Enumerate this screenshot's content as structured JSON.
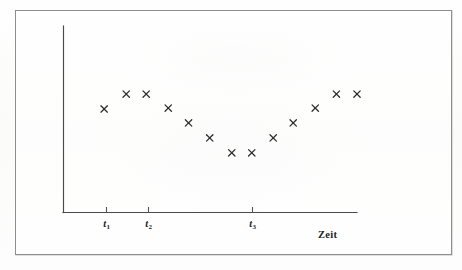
{
  "figure": {
    "frame": {
      "x": 15,
      "y": 10,
      "width": 435,
      "height": 243,
      "border_color": "#8e8e8e"
    },
    "background_color": "#fdfdfc",
    "ink_color": "#2b2b2b",
    "axis_color": "#4a4a4a"
  },
  "chart_data": {
    "type": "scatter",
    "title": "",
    "subtitle": "",
    "xlabel": "Zeit",
    "ylabel": "",
    "marker": "x",
    "marker_label": "cross-marker",
    "grid": false,
    "legend": null,
    "legend_position": "none",
    "xlim": [
      0,
      10
    ],
    "ylim": [
      0,
      10
    ],
    "axis_style": "open-L-axes-no-arrowheads",
    "tick_labels": [
      "t1",
      "t2",
      "t3"
    ],
    "tick_labels_display": [
      "t₁",
      "t₂",
      "t₃"
    ],
    "tick_positions_x": [
      1.5,
      2.9,
      6.4
    ],
    "x": [
      1.4,
      2.15,
      2.83,
      3.58,
      4.27,
      4.99,
      5.74,
      6.42,
      7.15,
      7.83,
      8.58,
      9.3,
      10.0
    ],
    "y": [
      5.55,
      6.35,
      6.35,
      5.6,
      4.8,
      4.0,
      3.2,
      3.2,
      4.0,
      4.8,
      5.6,
      6.35,
      6.35
    ],
    "points": [
      {
        "x": 1.4,
        "y": 5.55
      },
      {
        "x": 2.15,
        "y": 6.35
      },
      {
        "x": 2.83,
        "y": 6.35
      },
      {
        "x": 3.58,
        "y": 5.6
      },
      {
        "x": 4.27,
        "y": 4.8
      },
      {
        "x": 4.99,
        "y": 4.0
      },
      {
        "x": 5.74,
        "y": 3.2
      },
      {
        "x": 6.42,
        "y": 3.2
      },
      {
        "x": 7.15,
        "y": 4.0
      },
      {
        "x": 7.83,
        "y": 4.8
      },
      {
        "x": 8.58,
        "y": 5.6
      },
      {
        "x": 9.3,
        "y": 6.35
      },
      {
        "x": 10.0,
        "y": 6.35
      }
    ],
    "point_count": 13,
    "pattern": "U-shaped (convex) scatter with minimum between t2 and t3",
    "annotations": []
  },
  "labels": {
    "t1": "t",
    "t1_sub": "1",
    "t2": "t",
    "t2_sub": "2",
    "t3": "t",
    "t3_sub": "3",
    "axis_title": "Zeit"
  }
}
